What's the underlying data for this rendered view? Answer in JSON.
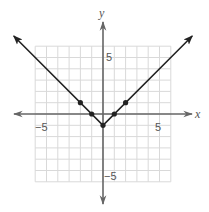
{
  "chart_data": {
    "type": "line",
    "title": "",
    "function": "y = |x| - 1",
    "xlabel": "x",
    "ylabel": "y",
    "xlim": [
      -6,
      6
    ],
    "ylim": [
      -6,
      6
    ],
    "grid": true,
    "tick_labels": {
      "x": [
        {
          "value": -5,
          "label": "−5"
        },
        {
          "value": 5,
          "label": "5"
        }
      ],
      "y": [
        {
          "value": 5,
          "label": "5"
        },
        {
          "value": -5,
          "label": "−5"
        }
      ]
    },
    "series": [
      {
        "name": "absolute value graph",
        "marked_points": [
          {
            "x": -2,
            "y": 1
          },
          {
            "x": -1,
            "y": 0
          },
          {
            "x": 0,
            "y": -1
          },
          {
            "x": 1,
            "y": 0
          },
          {
            "x": 2,
            "y": 1
          }
        ],
        "vertex": {
          "x": 0,
          "y": -1
        },
        "arrows_both_ends": true
      }
    ],
    "colors": {
      "grid": "#d9d9d9",
      "axis": "#666666",
      "line": "#222222"
    }
  },
  "labels": {
    "x_axis": "x",
    "y_axis": "y",
    "x_neg5": "−5",
    "x_pos5": "5",
    "y_pos5": "5",
    "y_neg5": "−5"
  }
}
